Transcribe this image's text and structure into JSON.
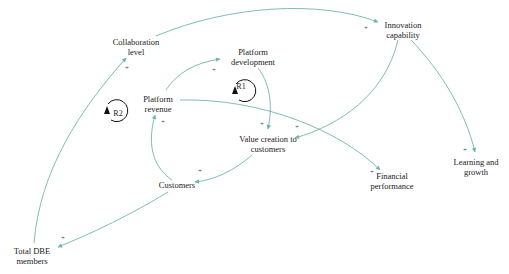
{
  "diagram": {
    "type": "causal-loop-diagram",
    "link_color": "#6fb5ad",
    "loop_color": "#111111",
    "nodes": {
      "collaboration_level": {
        "line1": "Collaboration",
        "line2": "level"
      },
      "platform_development": {
        "line1": "Platform",
        "line2": "development"
      },
      "innovation_capability": {
        "line1": "Innovation",
        "line2": "capability"
      },
      "platform_revenue": {
        "line1": "Platform",
        "line2": "revenue"
      },
      "value_creation": {
        "line1": "Value creation to",
        "line2": "customers"
      },
      "financial_performance": {
        "line1": "Financial",
        "line2": "performance"
      },
      "learning_growth": {
        "line1": "Learning and",
        "line2": "growth"
      },
      "customers": {
        "line1": "Customers"
      },
      "total_dbe_members": {
        "line1": "Total DBE",
        "line2": "members"
      }
    },
    "loops": {
      "r1": {
        "label": "R1",
        "type": "reinforcing"
      },
      "r2": {
        "label": "R2",
        "type": "reinforcing"
      }
    },
    "links": [
      {
        "from": "Total DBE members",
        "to": "Collaboration level",
        "polarity": "+"
      },
      {
        "from": "Collaboration level",
        "to": "Innovation capability",
        "polarity": "+"
      },
      {
        "from": "Platform revenue",
        "to": "Platform development",
        "polarity": "+"
      },
      {
        "from": "Platform development",
        "to": "Value creation to customers",
        "polarity": "+"
      },
      {
        "from": "Innovation capability",
        "to": "Value creation to customers",
        "polarity": "+"
      },
      {
        "from": "Innovation capability",
        "to": "Learning and growth",
        "polarity": "+"
      },
      {
        "from": "Platform revenue",
        "to": "Financial performance",
        "polarity": "+"
      },
      {
        "from": "Value creation to customers",
        "to": "Customers",
        "polarity": "+"
      },
      {
        "from": "Customers",
        "to": "Platform revenue",
        "polarity": "+"
      },
      {
        "from": "Customers",
        "to": "Total DBE members",
        "polarity": "+"
      }
    ],
    "polarity_symbol": "+"
  }
}
